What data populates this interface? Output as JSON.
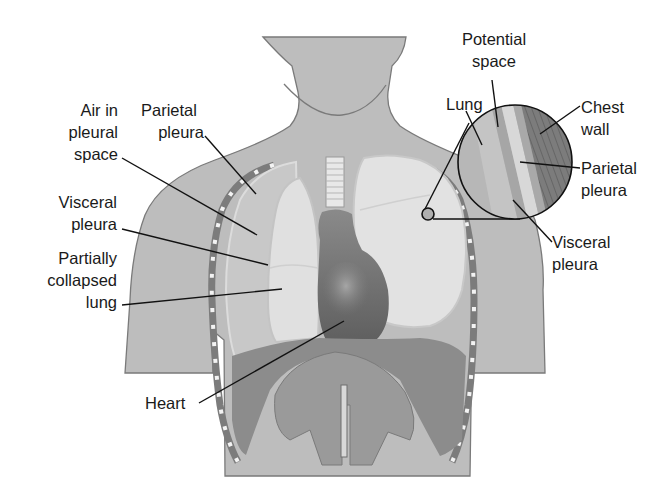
{
  "diagram": {
    "colors": {
      "background": "#ffffff",
      "body": "#bdbdbd",
      "body_outline": "#7a7a7a",
      "lung_light": "#e2e2e2",
      "lung_mid": "#d0d0d0",
      "heart": "#6e6e6e",
      "diaphragm": "#8c8c8c",
      "chest_wall": "#7c7c7c",
      "leader_line": "#111111",
      "text": "#1a1a1a"
    },
    "labels_left": [
      {
        "id": "air-in-pleural-space",
        "lines": [
          "Air in",
          "pleural",
          "space"
        ]
      },
      {
        "id": "parietal-pleura-left",
        "lines": [
          "Parietal",
          "pleura"
        ]
      },
      {
        "id": "visceral-pleura-left",
        "lines": [
          "Visceral",
          "pleura"
        ]
      },
      {
        "id": "partially-collapsed-lung",
        "lines": [
          "Partially",
          "collapsed",
          "lung"
        ]
      },
      {
        "id": "heart",
        "lines": [
          "Heart"
        ]
      }
    ],
    "labels_inset": [
      {
        "id": "potential-space",
        "lines": [
          "Potential",
          "space"
        ]
      },
      {
        "id": "lung",
        "lines": [
          "Lung"
        ]
      },
      {
        "id": "chest-wall",
        "lines": [
          "Chest",
          "wall"
        ]
      },
      {
        "id": "parietal-pleura-right",
        "lines": [
          "Parietal",
          "pleura"
        ]
      },
      {
        "id": "visceral-pleura-right",
        "lines": [
          "Visceral",
          "pleura"
        ]
      }
    ]
  }
}
